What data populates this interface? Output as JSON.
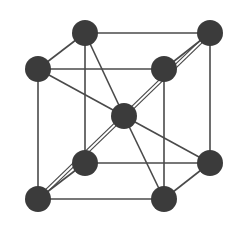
{
  "diagram": {
    "type": "body-centered-cubic-unit-cell",
    "atom_color": "#3b3b3b",
    "line_color": "#4a4a4a",
    "background": "#ffffff",
    "atom_radius": 13,
    "atoms": [
      {
        "id": "back-top-left",
        "x": 85,
        "y": 33
      },
      {
        "id": "back-top-right",
        "x": 210,
        "y": 33
      },
      {
        "id": "front-top-left",
        "x": 38,
        "y": 69
      },
      {
        "id": "front-top-right",
        "x": 164,
        "y": 69
      },
      {
        "id": "center",
        "x": 124,
        "y": 116
      },
      {
        "id": "back-bottom-left",
        "x": 85,
        "y": 163
      },
      {
        "id": "back-bottom-right",
        "x": 210,
        "y": 163
      },
      {
        "id": "front-bottom-left",
        "x": 38,
        "y": 199
      },
      {
        "id": "front-bottom-right",
        "x": 164,
        "y": 199
      }
    ],
    "edges": [
      [
        "back-top-left",
        "back-top-right"
      ],
      [
        "front-top-left",
        "front-top-right"
      ],
      [
        "back-top-left",
        "front-top-left"
      ],
      [
        "back-top-right",
        "front-top-right"
      ],
      [
        "back-bottom-left",
        "back-bottom-right"
      ],
      [
        "front-bottom-left",
        "front-bottom-right"
      ],
      [
        "back-bottom-left",
        "front-bottom-left"
      ],
      [
        "back-bottom-right",
        "front-bottom-right"
      ],
      [
        "back-top-left",
        "back-bottom-left"
      ],
      [
        "back-top-right",
        "back-bottom-right"
      ],
      [
        "front-top-left",
        "front-bottom-left"
      ],
      [
        "front-top-right",
        "front-bottom-right"
      ],
      [
        "back-top-left",
        "center"
      ],
      [
        "front-top-left",
        "center"
      ],
      [
        "center",
        "back-bottom-right"
      ],
      [
        "center",
        "front-bottom-right"
      ]
    ],
    "double_edges": [
      [
        "back-top-right",
        "front-bottom-left"
      ]
    ]
  }
}
